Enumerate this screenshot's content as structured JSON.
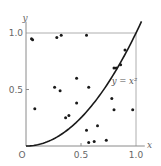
{
  "chart_data": {
    "type": "scatter",
    "title": "",
    "xlabel": "x",
    "ylabel": "y",
    "xlim": [
      0,
      1.0
    ],
    "ylim": [
      0,
      1.0
    ],
    "grid": false,
    "x_ticks": [
      "0",
      "0.5",
      "1.0"
    ],
    "y_ticks": [
      "0.5",
      "1.0"
    ],
    "origin_label": "O",
    "series": [
      {
        "name": "random points",
        "kind": "scatter",
        "points": [
          [
            0.05,
            0.95
          ],
          [
            0.06,
            0.94
          ],
          [
            0.28,
            0.96
          ],
          [
            0.32,
            0.98
          ],
          [
            0.55,
            0.98
          ],
          [
            0.9,
            0.85
          ],
          [
            0.8,
            0.69
          ],
          [
            0.82,
            0.69
          ],
          [
            0.86,
            0.72
          ],
          [
            0.46,
            0.6
          ],
          [
            0.26,
            0.52
          ],
          [
            0.31,
            0.49
          ],
          [
            0.57,
            0.52
          ],
          [
            0.46,
            0.38
          ],
          [
            0.08,
            0.33
          ],
          [
            0.36,
            0.25
          ],
          [
            0.39,
            0.27
          ],
          [
            0.78,
            0.42
          ],
          [
            0.8,
            0.32
          ],
          [
            0.97,
            0.32
          ],
          [
            0.65,
            0.18
          ],
          [
            0.55,
            0.14
          ],
          [
            0.73,
            0.05
          ],
          [
            0.57,
            0.03
          ],
          [
            0.62,
            0.04
          ]
        ]
      },
      {
        "name": "y = x²",
        "kind": "line",
        "function": "x^2",
        "x_range": [
          0,
          1.05
        ]
      }
    ],
    "annotations": [
      {
        "text": "y = x²",
        "x": 0.78,
        "y": 0.55
      }
    ],
    "frame": {
      "top_line_y": 1.0,
      "right_line_x": 1.0
    }
  }
}
